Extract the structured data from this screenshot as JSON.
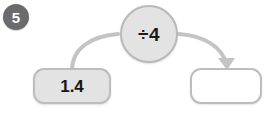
{
  "question": {
    "number": "5"
  },
  "machine": {
    "input": {
      "value": "1.4",
      "placeholder": ""
    },
    "operation": {
      "label": "÷4",
      "icon": "divide-icon"
    },
    "output": {
      "value": "",
      "placeholder": ""
    },
    "arrows": {
      "input_arrow_name": "input-to-operation-arrow",
      "output_arrow_name": "operation-to-output-arrow"
    }
  },
  "colors": {
    "badge_fill": "#6b6b6b",
    "badge_text": "#ffffff",
    "shape_fill": "#e3e3e3",
    "shape_border": "#bdbdbd",
    "output_fill": "#ffffff",
    "arrow_stroke": "#c4c4c4",
    "text": "#161616",
    "background": "#ffffff"
  }
}
